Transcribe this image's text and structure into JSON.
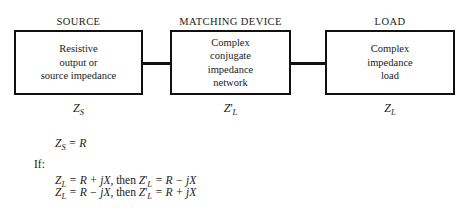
{
  "diagram": {
    "blocks": [
      {
        "header": "SOURCE",
        "lines": [
          "Resistive",
          "output or",
          "source impedance"
        ],
        "label_main": "Z",
        "label_sub": "S",
        "label_prime": ""
      },
      {
        "header": "MATCHING DEVICE",
        "lines": [
          "Complex",
          "conjugate",
          "impedance",
          "network"
        ],
        "label_main": "Z",
        "label_sub": "L",
        "label_prime": "'"
      },
      {
        "header": "LOAD",
        "lines": [
          "Complex",
          "impedance",
          "load"
        ],
        "label_main": "Z",
        "label_sub": "L",
        "label_prime": ""
      }
    ],
    "equations": {
      "zs_main": "Z",
      "zs_sub": "S",
      "zs_rest": " = R",
      "if_label": "If:",
      "line1": {
        "lhs_main": "Z",
        "lhs_sub": "L",
        "lhs_rest": " = R + jX,",
        "then": "then",
        "rhs_main": "Z",
        "rhs_prime": "'",
        "rhs_sub": "L",
        "rhs_rest": " = R − jX"
      },
      "line2": {
        "lhs_main": "Z",
        "lhs_sub": "L",
        "lhs_rest": " = R − jX,",
        "then": "then",
        "rhs_main": "Z",
        "rhs_prime": "'",
        "rhs_sub": "L",
        "rhs_rest": " = R + jX"
      }
    },
    "colors": {
      "stroke": "#111111",
      "background": "#ffffff",
      "text": "#1a1a1a"
    }
  }
}
